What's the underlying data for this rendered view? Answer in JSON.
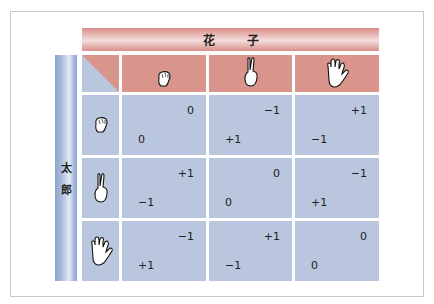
{
  "colors": {
    "banner": "#d9948c",
    "header_cell": "#d9948c",
    "body_cell": "#b9c6dd",
    "sidebar": "#a9bbdc",
    "frame_border": "#c8c8c8"
  },
  "banner": {
    "label_1": "花",
    "label_2": "子"
  },
  "sidebar": {
    "label_1": "太",
    "label_2": "郎"
  },
  "columns": [
    {
      "icon": "rock-hand-icon"
    },
    {
      "icon": "scissors-hand-icon"
    },
    {
      "icon": "paper-hand-icon"
    }
  ],
  "rows": [
    {
      "icon": "rock-hand-icon",
      "cells": [
        {
          "hanako": "0",
          "taro": "0"
        },
        {
          "hanako": "−1",
          "taro": "+1"
        },
        {
          "hanako": "+1",
          "taro": "−1"
        }
      ]
    },
    {
      "icon": "scissors-hand-icon",
      "cells": [
        {
          "hanako": "+1",
          "taro": "−1"
        },
        {
          "hanako": "0",
          "taro": "0"
        },
        {
          "hanako": "−1",
          "taro": "+1"
        }
      ]
    },
    {
      "icon": "paper-hand-icon",
      "cells": [
        {
          "hanako": "−1",
          "taro": "+1"
        },
        {
          "hanako": "+1",
          "taro": "−1"
        },
        {
          "hanako": "0",
          "taro": "0"
        }
      ]
    }
  ]
}
